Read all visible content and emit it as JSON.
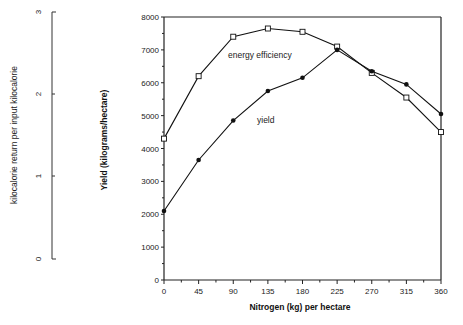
{
  "chart_data": {
    "type": "line",
    "title": "",
    "xlabel": "Nitrogen (kg) per hectare",
    "ylabel": "Yield    (kilograms/hectare)",
    "y2label": "kilocalorie  return  per  input  kilocalorie",
    "x": [
      0,
      45,
      90,
      135,
      180,
      225,
      270,
      315,
      360
    ],
    "x_ticks": [
      "0",
      "45",
      "90",
      "135",
      "180",
      "225",
      "270",
      "315",
      "360"
    ],
    "y_ticks": [
      "0",
      "1000",
      "2000",
      "3000",
      "4000",
      "5000",
      "6000",
      "7000",
      "8000"
    ],
    "y2_ticks": [
      "0",
      "1",
      "2",
      "3"
    ],
    "ylim": [
      0,
      8000
    ],
    "y2lim": [
      0,
      3
    ],
    "xlim": [
      0,
      360
    ],
    "grid": false,
    "series": [
      {
        "name": "energy efficiency",
        "marker": "square",
        "axis": "secondary",
        "values_on_primary_scale": [
          4300,
          6200,
          7400,
          7650,
          7550,
          7100,
          6300,
          5550,
          4500
        ]
      },
      {
        "name": "yield",
        "marker": "filled-circle",
        "axis": "primary",
        "values": [
          2100,
          3650,
          4850,
          5750,
          6150,
          7000,
          6350,
          5950,
          5050
        ]
      }
    ],
    "annotations": [
      "energy efficiency",
      "yield"
    ]
  }
}
